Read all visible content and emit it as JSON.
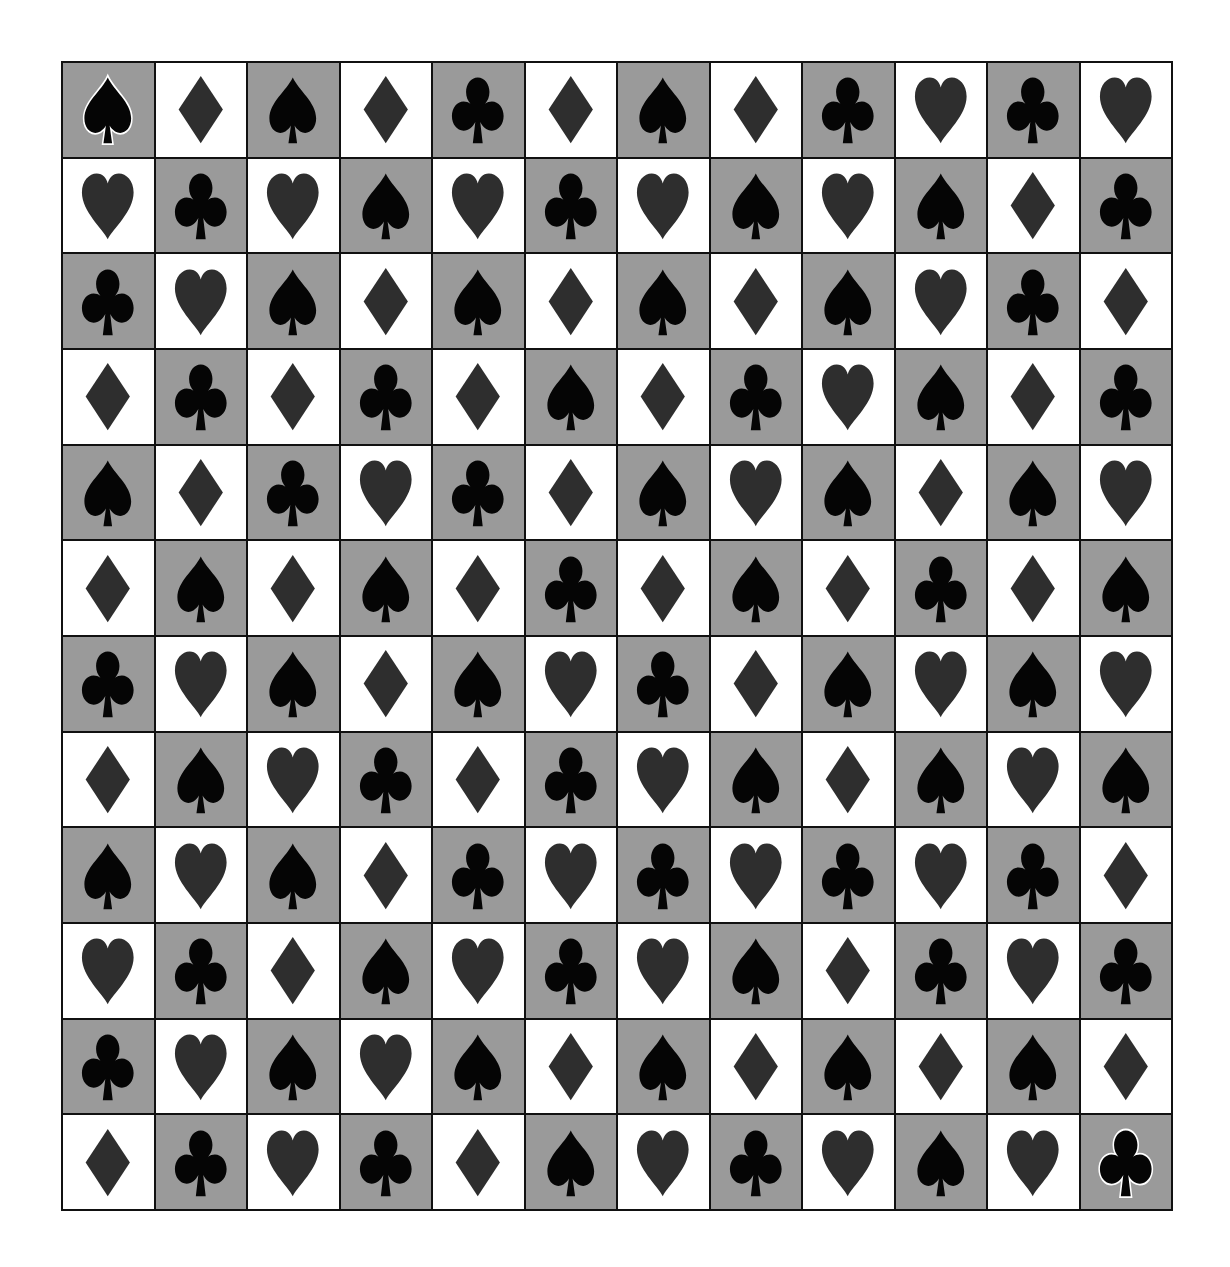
{
  "board": {
    "rows": 12,
    "cols": 12,
    "colors": {
      "light_cell": "#ffffff",
      "dark_cell": "#9a9a9a",
      "black_suit": "#050505",
      "gray_suit": "#2e2e2e",
      "grid_line": "#111111",
      "highlight_outline": "#ffffff"
    },
    "legend": {
      "S": "spade",
      "H": "heart",
      "D": "diamond",
      "C": "club"
    },
    "grid": [
      [
        "S",
        "D",
        "S",
        "D",
        "C",
        "D",
        "S",
        "D",
        "C",
        "H",
        "C",
        "H"
      ],
      [
        "H",
        "C",
        "H",
        "S",
        "H",
        "C",
        "H",
        "S",
        "H",
        "S",
        "D",
        "C"
      ],
      [
        "C",
        "H",
        "S",
        "D",
        "S",
        "D",
        "S",
        "D",
        "S",
        "H",
        "C",
        "D"
      ],
      [
        "D",
        "C",
        "D",
        "C",
        "D",
        "S",
        "D",
        "C",
        "H",
        "S",
        "D",
        "C"
      ],
      [
        "S",
        "D",
        "C",
        "H",
        "C",
        "D",
        "S",
        "H",
        "S",
        "D",
        "S",
        "H"
      ],
      [
        "D",
        "S",
        "D",
        "S",
        "D",
        "C",
        "D",
        "S",
        "D",
        "C",
        "D",
        "S"
      ],
      [
        "C",
        "H",
        "S",
        "D",
        "S",
        "H",
        "C",
        "D",
        "S",
        "H",
        "S",
        "H"
      ],
      [
        "D",
        "S",
        "H",
        "C",
        "D",
        "C",
        "H",
        "S",
        "D",
        "S",
        "H",
        "S"
      ],
      [
        "S",
        "H",
        "S",
        "D",
        "C",
        "H",
        "C",
        "H",
        "C",
        "H",
        "C",
        "D"
      ],
      [
        "H",
        "C",
        "D",
        "S",
        "H",
        "C",
        "H",
        "S",
        "D",
        "C",
        "H",
        "C"
      ],
      [
        "C",
        "H",
        "S",
        "H",
        "S",
        "D",
        "S",
        "D",
        "S",
        "D",
        "S",
        "D"
      ],
      [
        "D",
        "C",
        "H",
        "C",
        "D",
        "S",
        "H",
        "C",
        "H",
        "S",
        "H",
        "C"
      ]
    ],
    "highlighted": [
      {
        "row": 0,
        "col": 0,
        "suit": "S",
        "role": "start"
      },
      {
        "row": 11,
        "col": 11,
        "suit": "C",
        "role": "end"
      }
    ]
  }
}
